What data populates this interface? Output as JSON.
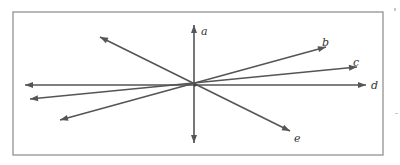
{
  "diagram": {
    "lines": [
      {
        "id": "a",
        "label": "a",
        "orientation": "vertical"
      },
      {
        "id": "b",
        "label": "b",
        "orientation": "rising to upper-right"
      },
      {
        "id": "c",
        "label": "c",
        "orientation": "slight rise to right"
      },
      {
        "id": "d",
        "label": "d",
        "orientation": "horizontal"
      },
      {
        "id": "e",
        "label": "e",
        "orientation": "falling to lower-right"
      }
    ],
    "colors": {
      "line": "#555555",
      "frame": "#9a9a9a",
      "label": "#333333"
    }
  }
}
